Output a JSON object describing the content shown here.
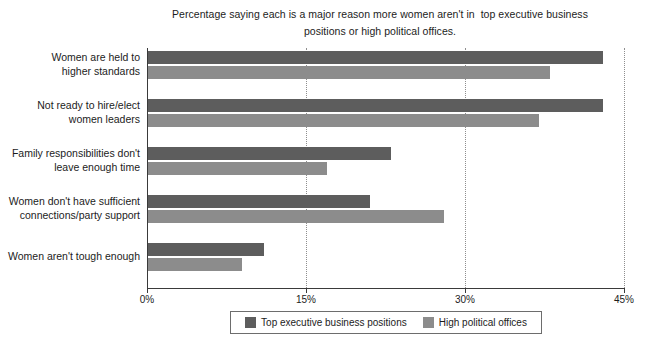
{
  "chart_data": {
    "type": "bar",
    "orientation": "horizontal",
    "title": "Percentage saying each is a major reason more women aren't in  top executive business positions or high political offices.",
    "xlabel": "",
    "ylabel": "",
    "xlim": [
      0,
      45
    ],
    "xticks": [
      0,
      15,
      30,
      45
    ],
    "xtick_labels": [
      "0%",
      "15%",
      "30%",
      "45%"
    ],
    "grid": "vertical-dotted",
    "legend_position": "bottom-center",
    "categories": [
      "Women are held to\nhigher standards",
      "Not ready to hire/elect\nwomen leaders",
      "Family responsibilities don't\nleave enough time",
      "Women don't have sufficient\nconnections/party support",
      "Women aren't tough enough"
    ],
    "series": [
      {
        "name": "Top executive business positions",
        "color": "#5d5d5d",
        "values": [
          43,
          43,
          23,
          21,
          11
        ]
      },
      {
        "name": "High political offices",
        "color": "#8c8c8c",
        "values": [
          38,
          37,
          17,
          28,
          9
        ]
      }
    ]
  },
  "legend": {
    "items": [
      {
        "label": "Top executive business positions"
      },
      {
        "label": "High political offices"
      }
    ]
  }
}
